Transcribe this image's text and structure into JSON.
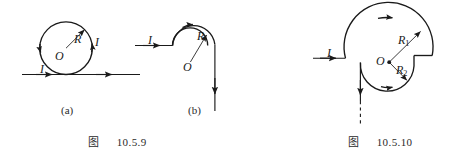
{
  "page": {
    "background_color": "#ffffff",
    "stroke_color": "#1a1a1a",
    "width": 463,
    "height": 161
  },
  "figure_9": {
    "caption_cjk": "图",
    "caption_number": "10.5.9",
    "panels": [
      {
        "id": "a",
        "sublabel": "(a)",
        "description": "circle tangent to straight wire",
        "labels": {
          "radius": "R",
          "center": "O",
          "current_wire": "I",
          "current_loop": "I"
        }
      },
      {
        "id": "b",
        "sublabel": "(b)",
        "description": "straight wire into three-quarter arc then vertical wire",
        "labels": {
          "radius": "R",
          "center": "O",
          "current_wire": "I"
        }
      }
    ]
  },
  "figure_10": {
    "caption_cjk": "图",
    "caption_number": "10.5.10",
    "description": "two concentric arcs of radii R1 and R2 joined by radial segment, fed by straight wire",
    "labels": {
      "radius_outer": "R",
      "radius_outer_sub": "1",
      "radius_inner": "R",
      "radius_inner_sub": "2",
      "center": "O",
      "current_wire": "I"
    }
  }
}
